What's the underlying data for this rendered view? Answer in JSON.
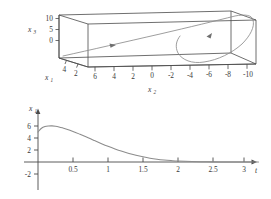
{
  "figure": {
    "background": "#ffffff",
    "line_color": "#4a4a4a",
    "curve_color": "#8c8c8c",
    "axis_color": "#4a4a4a",
    "text_color": "#3a3a3a"
  },
  "panel_3d": {
    "name": "phase-space-box-plot",
    "x1_axis": {
      "label": "x",
      "sub": "1",
      "ticks": [
        "4",
        "2"
      ]
    },
    "x2_axis": {
      "label": "x",
      "sub": "2",
      "ticks": [
        "6",
        "4",
        "2",
        "0",
        "-2",
        "-4",
        "-6",
        "-8",
        "-10"
      ]
    },
    "x3_axis": {
      "label": "x",
      "sub": "3",
      "ticks": [
        "10",
        "5",
        "0"
      ]
    }
  },
  "panel_2d": {
    "name": "x1-vs-t-time-series",
    "y_axis": {
      "label": "x",
      "sub": "1",
      "ticks": [
        "6",
        "4",
        "2",
        "-2"
      ]
    },
    "x_axis": {
      "label": "t",
      "ticks": [
        "0.5",
        "1",
        "1.5",
        "2",
        "2.5",
        "3"
      ]
    }
  },
  "chart_data": [
    {
      "type": "line",
      "name": "3d-trajectory",
      "title": "",
      "projection": "3d-box",
      "xlabel": "x2",
      "ylabel": "x1",
      "zlabel": "x3",
      "x1lim": [
        5,
        0
      ],
      "x2lim": [
        7,
        -11
      ],
      "x3lim": [
        -3,
        13
      ],
      "x1_ticks": [
        4,
        2
      ],
      "x2_ticks": [
        6,
        4,
        2,
        0,
        -2,
        -4,
        -6,
        -8,
        -10
      ],
      "x3_ticks": [
        0,
        5,
        10
      ],
      "grid": false,
      "legend": null,
      "annotations": [
        "arrowhead-on-upper-branch",
        "arrowhead-on-lower-branch"
      ],
      "series": [
        {
          "name": "trajectory",
          "x2": [
            6.6,
            5.0,
            3.0,
            1.0,
            -1.0,
            -3.0,
            -5.0,
            -7.0,
            -8.4,
            -9.2,
            -9.4,
            -9.0,
            -8.0,
            -6.5,
            -5.0,
            -3.6,
            -2.6,
            -2.0,
            -1.7,
            -1.8,
            -2.3
          ],
          "x3": [
            -2.3,
            -2.0,
            -1.6,
            -1.1,
            -0.5,
            0.3,
            1.3,
            2.7,
            4.3,
            6.2,
            8.0,
            9.6,
            10.7,
            11.0,
            10.6,
            9.6,
            8.2,
            6.5,
            4.6,
            2.6,
            0.6
          ],
          "x1": [
            0.2,
            0.4,
            0.8,
            1.2,
            1.7,
            2.2,
            2.7,
            3.2,
            3.6,
            3.9,
            4.1,
            4.2,
            4.1,
            3.8,
            3.4,
            2.9,
            2.4,
            1.9,
            1.4,
            1.0,
            0.6
          ]
        }
      ]
    },
    {
      "type": "line",
      "name": "x1-time-series",
      "title": "",
      "xlabel": "t",
      "ylabel": "x1",
      "xlim": [
        -0.18,
        3.25
      ],
      "ylim": [
        -2.6,
        7.2
      ],
      "xticks": [
        0.5,
        1,
        1.5,
        2,
        2.5,
        3
      ],
      "yticks": [
        -2,
        2,
        4,
        6
      ],
      "grid": false,
      "legend": null,
      "x": [
        0.0,
        0.05,
        0.1,
        0.15,
        0.2,
        0.25,
        0.3,
        0.35,
        0.4,
        0.5,
        0.6,
        0.7,
        0.8,
        0.9,
        1.0,
        1.1,
        1.2,
        1.3,
        1.4,
        1.5,
        1.6,
        1.7,
        1.8,
        1.9,
        2.0,
        2.2,
        2.4,
        2.6,
        2.8,
        3.0,
        3.15
      ],
      "y": [
        5.0,
        5.62,
        5.9,
        6.0,
        6.02,
        5.96,
        5.85,
        5.7,
        5.52,
        5.1,
        4.62,
        4.12,
        3.6,
        3.1,
        2.62,
        2.18,
        1.78,
        1.42,
        1.12,
        0.86,
        0.64,
        0.47,
        0.34,
        0.24,
        0.16,
        0.07,
        0.03,
        0.01,
        0.0,
        0.0,
        0.0
      ]
    }
  ]
}
